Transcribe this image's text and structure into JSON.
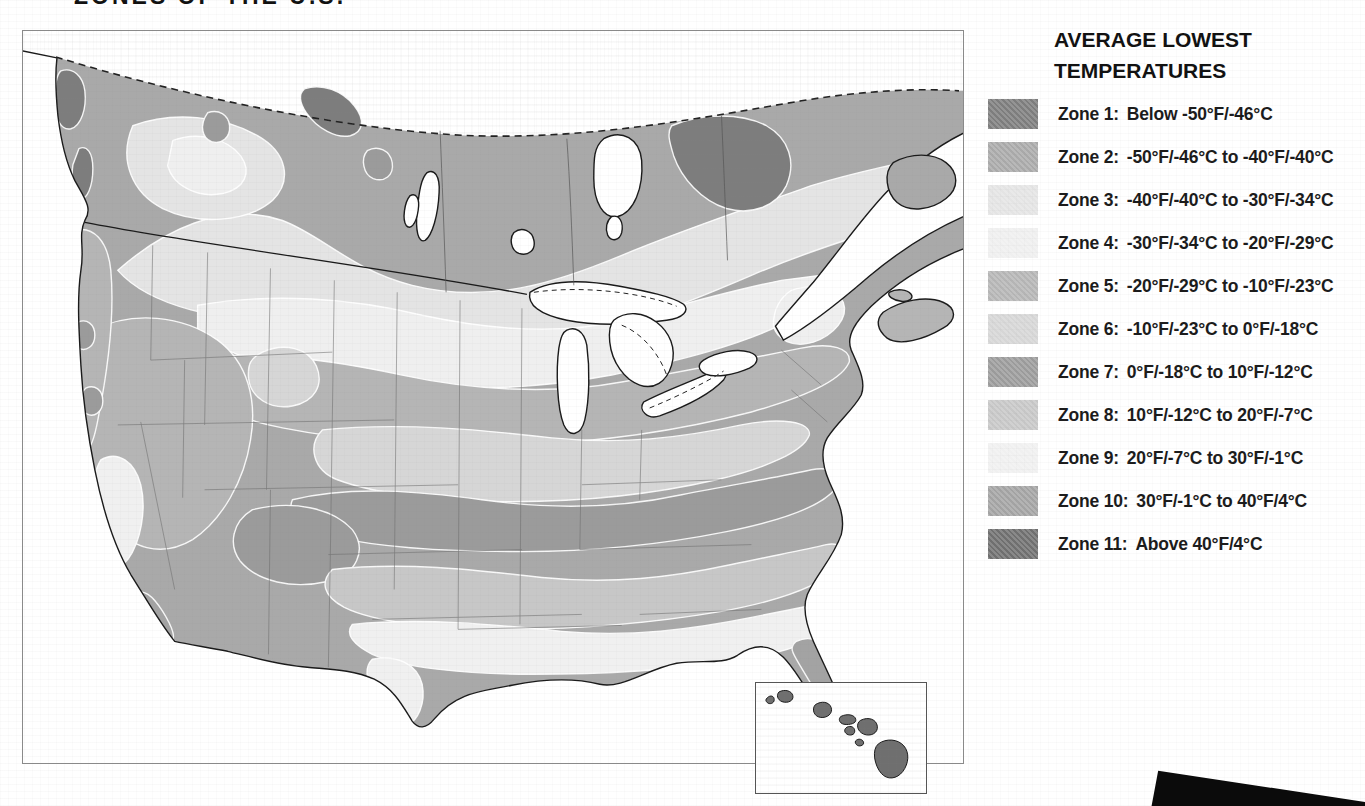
{
  "page": {
    "title_partial": "ZONES OF THE U.S."
  },
  "legend": {
    "title_line1": "AVERAGE LOWEST",
    "title_line2": "TEMPERATURES",
    "items": [
      {
        "zone": "Zone 1:",
        "range": "Below -50°F/-46°C",
        "color_key": "z1"
      },
      {
        "zone": "Zone 2:",
        "range": "-50°F/-46°C to -40°F/-40°C",
        "color_key": "z2"
      },
      {
        "zone": "Zone 3:",
        "range": "-40°F/-40°C to -30°F/-34°C",
        "color_key": "z3"
      },
      {
        "zone": "Zone 4:",
        "range": "-30°F/-34°C to -20°F/-29°C",
        "color_key": "z4"
      },
      {
        "zone": "Zone 5:",
        "range": "-20°F/-29°C to -10°F/-23°C",
        "color_key": "z5"
      },
      {
        "zone": "Zone 6:",
        "range": "-10°F/-23°C to 0°F/-18°C",
        "color_key": "z6"
      },
      {
        "zone": "Zone 7:",
        "range": "0°F/-18°C to 10°F/-12°C",
        "color_key": "z7"
      },
      {
        "zone": "Zone 8:",
        "range": "10°F/-12°C to 20°F/-7°C",
        "color_key": "z8"
      },
      {
        "zone": "Zone 9:",
        "range": "20°F/-7°C to 30°F/-1°C",
        "color_key": "z9"
      },
      {
        "zone": "Zone 10:",
        "range": "30°F/-1°C to 40°F/4°C",
        "color_key": "z10"
      },
      {
        "zone": "Zone 11:",
        "range": "Above 40°F/4°C",
        "color_key": "z11"
      }
    ]
  },
  "map": {
    "zone_colors": {
      "z1": "#7d7d7d",
      "z2": "#a9a9a9",
      "z3": "#e4e4e4",
      "z4": "#efefef",
      "z5": "#b5b5b5",
      "z6": "#d6d6d6",
      "z7": "#9b9b9b",
      "z8": "#c7c7c7",
      "z9": "#f0f0f0",
      "z10": "#a3a3a3",
      "z11": "#6f6f6f"
    },
    "sea_color": "#ffffff",
    "outline_color": "#1a1a1a",
    "regions": [
      "united-states",
      "southern-canada",
      "hawaii-inset"
    ]
  }
}
